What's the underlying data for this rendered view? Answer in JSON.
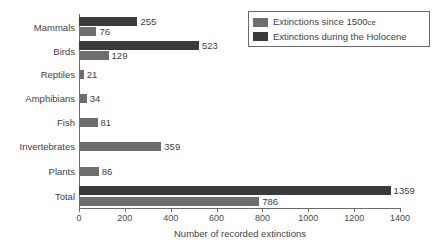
{
  "chart_data": {
    "type": "bar",
    "title": "",
    "xlabel": "Number of recorded extinctions",
    "ylabel": "",
    "orientation": "horizontal",
    "xlim": [
      0,
      1400
    ],
    "xticks": [
      0,
      200,
      400,
      600,
      800,
      1000,
      1200,
      1400
    ],
    "xtick_labels": [
      "0",
      "200",
      "400",
      "600",
      "800",
      "1000",
      "1200",
      "1400"
    ],
    "grid": false,
    "legend_position": "top-right",
    "categories": [
      "Mammals",
      "Birds",
      "Reptiles",
      "Amphibians",
      "Fish",
      "Invertebrates",
      "Plants",
      "Total"
    ],
    "series": [
      {
        "name": "Extinctions during the Holocene",
        "color": "#3a3a3a",
        "values": [
          255,
          523,
          null,
          null,
          null,
          null,
          null,
          1359
        ],
        "labels": [
          "255",
          "523",
          "",
          "",
          "",
          "",
          "",
          "1359"
        ]
      },
      {
        "name": "Extinctions since 1500 CE",
        "color": "#6e6e6e",
        "values": [
          76,
          129,
          21,
          34,
          81,
          359,
          86,
          786
        ],
        "labels": [
          "76",
          "129",
          "21",
          "34",
          "81",
          "359",
          "86",
          "786"
        ]
      }
    ]
  },
  "legend": {
    "items": [
      {
        "label_main": "Extinctions since 1500",
        "label_small": "ce",
        "color": "#6e6e6e"
      },
      {
        "label_main": "Extinctions during the Holocene",
        "label_small": "",
        "color": "#3a3a3a"
      }
    ]
  },
  "axis": {
    "title": "Number of recorded extinctions"
  }
}
